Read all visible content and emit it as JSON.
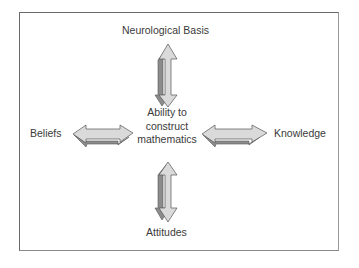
{
  "diagram": {
    "center": {
      "lines": [
        "Ability to",
        "construct",
        "mathematics"
      ]
    },
    "nodes": {
      "top": "Neurological Basis",
      "left": "Beliefs",
      "right": "Knowledge",
      "bottom": "Attitudes"
    },
    "connections": [
      {
        "from": "Neurological Basis",
        "to": "Ability to construct mathematics",
        "type": "bidirectional-arrow"
      },
      {
        "from": "Beliefs",
        "to": "Ability to construct mathematics",
        "type": "bidirectional-arrow"
      },
      {
        "from": "Knowledge",
        "to": "Ability to construct mathematics",
        "type": "bidirectional-arrow"
      },
      {
        "from": "Attitudes",
        "to": "Ability to construct mathematics",
        "type": "bidirectional-arrow"
      }
    ],
    "colors": {
      "arrow_fill": "#d9d9d9",
      "arrow_shadow": "#8c8c8c",
      "arrow_stroke": "#555555",
      "frame": "#6a6a6a"
    }
  }
}
